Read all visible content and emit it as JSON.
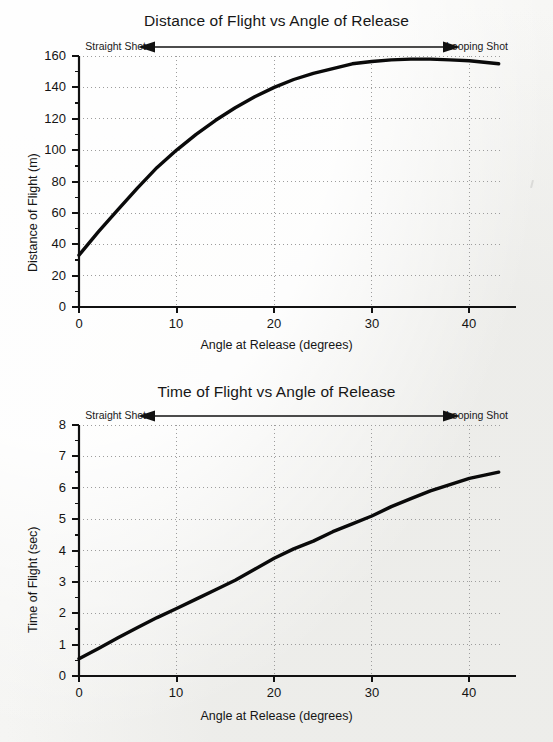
{
  "page": {
    "background_color": "#f4f4f2",
    "ink_color": "#141414",
    "grid_color": "#9a9a9a"
  },
  "charts": [
    {
      "id": "distance",
      "title": "Distance of Flight vs Angle of Release",
      "xlabel": "Angle at Release (degrees)",
      "ylabel": "Distance of Flight (m)",
      "annotation_left": "Straight Shot",
      "annotation_right": "Looping Shot",
      "ytick_labels": [
        "0",
        "20",
        "40",
        "60",
        "80",
        "100",
        "120",
        "140",
        "160"
      ],
      "xtick_labels": [
        "0",
        "10",
        "20",
        "30",
        "40"
      ]
    },
    {
      "id": "time",
      "title": "Time of Flight vs Angle of Release",
      "xlabel": "Angle at Release (degrees)",
      "ylabel": "Time of Flight (sec)",
      "annotation_left": "Straight Shot",
      "annotation_right": "Looping Shot",
      "ytick_labels": [
        "0",
        "1",
        "2",
        "3",
        "4",
        "5",
        "6",
        "7",
        "8"
      ],
      "xtick_labels": [
        "0",
        "10",
        "20",
        "30",
        "40"
      ]
    }
  ],
  "chart_data": [
    {
      "type": "line",
      "title": "Distance of Flight vs Angle of Release",
      "xlabel": "Angle at Release (degrees)",
      "ylabel": "Distance of Flight (m)",
      "xlim": [
        0,
        45
      ],
      "ylim": [
        0,
        160
      ],
      "xticks": [
        0,
        10,
        20,
        30,
        40
      ],
      "yticks": [
        0,
        20,
        40,
        60,
        80,
        100,
        120,
        140,
        160
      ],
      "grid": true,
      "legend": "none",
      "annotations": [
        {
          "text": "Straight Shot",
          "position": "above-plot-left",
          "arrow": "left"
        },
        {
          "text": "Looping Shot",
          "position": "above-plot-right",
          "arrow": "right"
        }
      ],
      "series": [
        {
          "name": "Distance of Flight",
          "x": [
            0,
            2,
            4,
            6,
            8,
            10,
            12,
            14,
            16,
            18,
            20,
            22,
            24,
            26,
            28,
            30,
            32,
            34,
            36,
            38,
            40,
            43
          ],
          "values": [
            33,
            48,
            62,
            76,
            89,
            100,
            110,
            119,
            127,
            134,
            140,
            145,
            149,
            152,
            155,
            156.5,
            157.5,
            158,
            158,
            157.5,
            157,
            155
          ]
        }
      ]
    },
    {
      "type": "line",
      "title": "Time of Flight vs Angle of Release",
      "xlabel": "Angle at Release (degrees)",
      "ylabel": "Time of Flight (sec)",
      "xlim": [
        0,
        45
      ],
      "ylim": [
        0,
        8
      ],
      "xticks": [
        0,
        10,
        20,
        30,
        40
      ],
      "yticks": [
        0,
        1,
        2,
        3,
        4,
        5,
        6,
        7,
        8
      ],
      "grid": true,
      "legend": "none",
      "annotations": [
        {
          "text": "Straight Shot",
          "position": "above-plot-left",
          "arrow": "left"
        },
        {
          "text": "Looping Shot",
          "position": "above-plot-right",
          "arrow": "right"
        }
      ],
      "series": [
        {
          "name": "Time of Flight",
          "x": [
            0,
            2,
            4,
            6,
            8,
            10,
            12,
            14,
            16,
            18,
            20,
            22,
            24,
            26,
            28,
            30,
            32,
            34,
            36,
            38,
            40,
            43
          ],
          "values": [
            0.55,
            0.88,
            1.22,
            1.55,
            1.86,
            2.15,
            2.45,
            2.75,
            3.05,
            3.4,
            3.75,
            4.05,
            4.3,
            4.6,
            4.85,
            5.1,
            5.4,
            5.65,
            5.9,
            6.1,
            6.3,
            6.5
          ]
        }
      ]
    }
  ]
}
